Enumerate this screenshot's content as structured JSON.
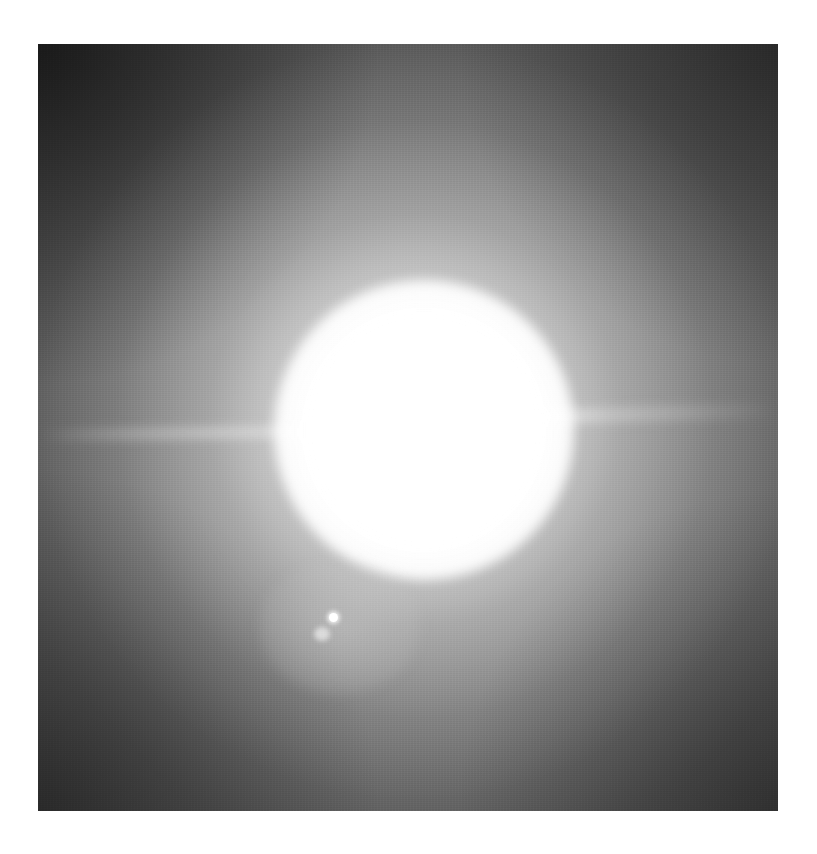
{
  "image": {
    "subject": "bright sun with lens flare",
    "tone": "grayscale",
    "frame": {
      "left": 38,
      "top": 44,
      "width": 740,
      "height": 767
    },
    "background_color": "#ffffff",
    "sun": {
      "center_x": 386,
      "center_y": 386,
      "core_color": "#ffffff"
    },
    "flare_dot": {
      "x": 295,
      "y": 573,
      "color": "#ffffff"
    },
    "edge_color": "#3a3a3a"
  }
}
